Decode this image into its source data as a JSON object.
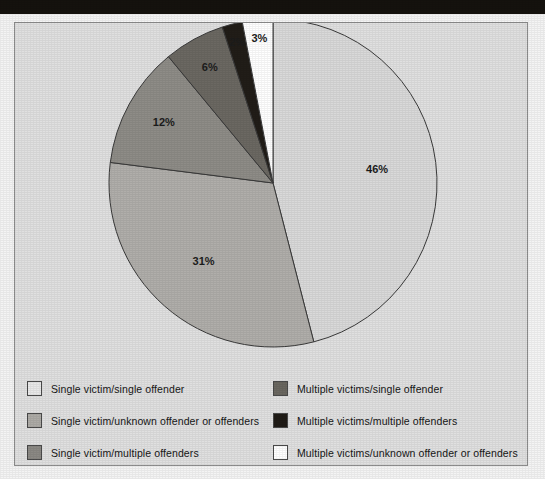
{
  "page": {
    "background_color": "#f4f4f4",
    "top_band_color": "#15120e",
    "chart_frame_color": "#e0e0e0",
    "chart_border_color": "#8d8d8d"
  },
  "chart_data": {
    "type": "pie",
    "title": "",
    "subtitle": "",
    "xlabel": "",
    "ylabel": "",
    "grid": false,
    "legend_position": "bottom",
    "start_angle_deg": 0,
    "direction": "clockwise",
    "center": {
      "x": 272,
      "y": 191
    },
    "radius": 164,
    "categories": [
      "Single victim/single offender",
      "Single victim/unknown offender or offenders",
      "Single victim/multiple offenders",
      "Multiple victims/single offender",
      "Multiple victims/multiple offenders",
      "Multiple victims/unknown offender or offenders"
    ],
    "values": [
      46,
      31,
      12,
      6,
      2,
      3
    ],
    "value_labels": [
      "46%",
      "31%",
      "12%",
      "6%",
      "2%",
      "3%"
    ],
    "colors": [
      "#d9d9d9",
      "#b0aeaa",
      "#8e8c87",
      "#6b6862",
      "#211d18",
      "#ffffff"
    ],
    "slice_border_color": "#3a3a3a"
  },
  "slices": [
    {
      "label": "46%",
      "value": 46,
      "color": "#d9d9d9",
      "name": "single-victim-single-offender"
    },
    {
      "label": "31%",
      "value": 31,
      "color": "#b0aeaa",
      "name": "single-victim-unknown-offenders"
    },
    {
      "label": "12%",
      "value": 12,
      "color": "#8e8c87",
      "name": "single-victim-multiple-offenders"
    },
    {
      "label": "6%",
      "value": 6,
      "color": "#6b6862",
      "name": "multiple-victims-single-offender"
    },
    {
      "label": "2%",
      "value": 2,
      "color": "#211d18",
      "name": "multiple-victims-multiple-offenders"
    },
    {
      "label": "3%",
      "value": 3,
      "color": "#ffffff",
      "name": "multiple-victims-unknown-offenders"
    }
  ],
  "legend": {
    "left_column": [
      {
        "label": "Single victim/single offender",
        "color": "#e8e8e8"
      },
      {
        "label": "Single victim/unknown offender or offenders",
        "color": "#adaba6"
      },
      {
        "label": "Single victim/multiple offenders",
        "color": "#8b8984"
      }
    ],
    "right_column": [
      {
        "label": "Multiple victims/single offender",
        "color": "#6a6760"
      },
      {
        "label": "Multiple victims/multiple offenders",
        "color": "#201c17"
      },
      {
        "label": "Multiple victims/unknown offender or offenders",
        "color": "#ffffff"
      }
    ]
  }
}
